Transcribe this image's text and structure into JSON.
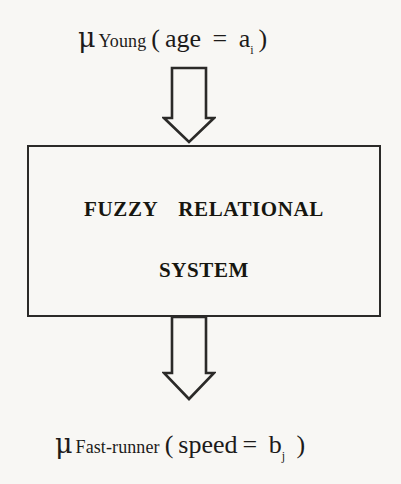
{
  "diagram": {
    "background_color": "#f8f7f4",
    "ink_color": "#1d1b1a",
    "input_label": {
      "mu": "μ",
      "subject": "Young",
      "open_paren": "(",
      "variable": "age",
      "equals": " = ",
      "value": "a",
      "value_index": "i",
      "close_paren": ")"
    },
    "output_label": {
      "mu": "μ",
      "subject": "Fast-runner",
      "open_paren": "(",
      "variable": "speed",
      "equals": "= ",
      "value": "b",
      "value_index": "j",
      "close_paren": " )"
    },
    "box": {
      "line1_word1": "FUZZY",
      "line1_word2": "RELATIONAL",
      "line2": "SYSTEM",
      "border_color": "#2b2a28"
    },
    "arrows": {
      "input_direction": "down",
      "output_direction": "down",
      "stroke_color": "#2b2a28",
      "fill": "none"
    }
  }
}
